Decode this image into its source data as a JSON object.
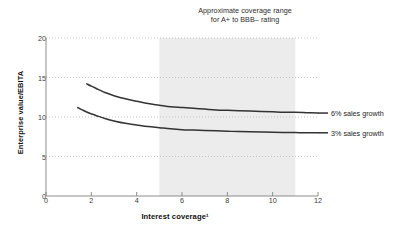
{
  "chart_data": {
    "type": "line",
    "title": "Approximate coverage range\nfor A+ to BBB– rating",
    "title_line1": "Approximate coverage range",
    "title_line2": "for A+ to BBB– rating",
    "xlabel": "Interest coverage¹",
    "ylabel": "Enterprise value/EBITA",
    "xlim": [
      0,
      12
    ],
    "ylim": [
      0,
      20
    ],
    "xticks": [
      0,
      2,
      4,
      6,
      8,
      10,
      12
    ],
    "yticks": [
      0,
      5,
      10,
      15,
      20
    ],
    "grid": "horizontal-dotted",
    "legend_position": "right-of-plot",
    "shaded_band": {
      "label": "Approximate coverage range for A+ to BBB– rating",
      "x_start": 5.0,
      "x_end": 11.0,
      "y_start": 0,
      "y_end": 20,
      "color": "#ececec"
    },
    "series": [
      {
        "name": "6% sales growth",
        "color": "#333333",
        "x": [
          1.8,
          2.0,
          2.3,
          2.6,
          3.0,
          3.5,
          4.0,
          4.5,
          5.0,
          5.5,
          6.0,
          6.5,
          7.0,
          7.5,
          8.0,
          8.5,
          9.0,
          9.5,
          10.0,
          10.5,
          11.0,
          11.5,
          12.0
        ],
        "values": [
          14.2,
          13.9,
          13.5,
          13.1,
          12.7,
          12.3,
          12.0,
          11.7,
          11.5,
          11.3,
          11.2,
          11.1,
          11.0,
          10.9,
          10.85,
          10.8,
          10.75,
          10.7,
          10.65,
          10.6,
          10.6,
          10.55,
          10.5
        ]
      },
      {
        "name": "3% sales growth",
        "color": "#333333",
        "x": [
          1.4,
          1.6,
          1.9,
          2.2,
          2.6,
          3.0,
          3.5,
          4.0,
          4.5,
          5.0,
          5.5,
          6.0,
          6.5,
          7.0,
          7.5,
          8.0,
          8.5,
          9.0,
          9.5,
          10.0,
          10.5,
          11.0,
          11.5,
          12.0
        ],
        "values": [
          11.2,
          10.9,
          10.5,
          10.2,
          9.8,
          9.5,
          9.2,
          9.0,
          8.8,
          8.65,
          8.5,
          8.4,
          8.35,
          8.3,
          8.25,
          8.2,
          8.15,
          8.12,
          8.1,
          8.08,
          8.05,
          8.03,
          8.0,
          8.0
        ]
      }
    ]
  },
  "axis": {
    "y_tick_labels": [
      "0",
      "5",
      "10",
      "15",
      "20"
    ],
    "x_tick_labels": [
      "0",
      "2",
      "4",
      "6",
      "8",
      "10",
      "12"
    ]
  },
  "legend": {
    "items": [
      {
        "label": "6% sales growth"
      },
      {
        "label": "3% sales growth"
      }
    ]
  },
  "colors": {
    "line": "#333333",
    "band": "#ececec",
    "grid": "#b9b9b9",
    "axis": "#8c8c8c",
    "text": "#1a1a1a"
  }
}
